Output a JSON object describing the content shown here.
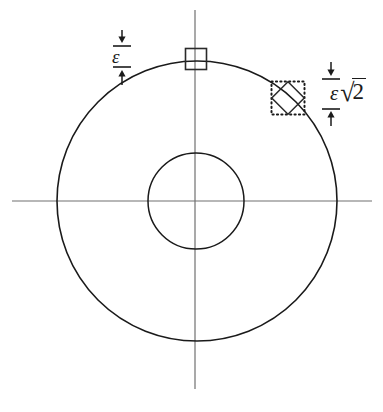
{
  "figure": {
    "background_color": "#ffffff",
    "width": 383,
    "height": 412
  },
  "colors": {
    "outer_circle": "#1a1a1a",
    "inner_circle": "#1a1a1a",
    "axis": "#707070",
    "cell_solid": "#2a2a2a",
    "cell_dotted": "#1a1a1a",
    "diamond": "#2a2a2a",
    "dimension": "#1b1b1b",
    "text": "#1b1b1b"
  },
  "axes": {
    "horizontal": {
      "x1": 12,
      "y1": 201,
      "x2": 372,
      "y2": 201
    },
    "vertical": {
      "x1": 195,
      "y1": 10,
      "x2": 195,
      "y2": 389
    }
  },
  "circles": {
    "outer": {
      "cx": 197,
      "cy": 201,
      "r": 140,
      "stroke_width": 1.6
    },
    "inner": {
      "cx": 196,
      "cy": 201,
      "r": 48,
      "stroke_width": 1.5
    }
  },
  "cells": {
    "axis_aligned": {
      "name": "square-cell-top",
      "cx": 196,
      "cy": 59,
      "size": 21,
      "stroke_style": "solid",
      "stroke_width": 1.6
    },
    "diagonal": {
      "name": "diagonal-cell-upper-right",
      "cx": 288,
      "cy": 98,
      "size": 33,
      "stroke_style": "dotted",
      "inner_rotation_deg": 45,
      "inner_size": 23
    }
  },
  "dimensions": {
    "left": {
      "label": "ε",
      "description": "epsilon",
      "arrow_top_x": 122,
      "arrow_top_y1": 30,
      "arrow_top_y2": 43,
      "tick_upper_y": 46,
      "tick_lower_y": 67,
      "arrow_bottom_y1": 85,
      "arrow_bottom_y2": 70,
      "tick_half_width": 9
    },
    "right": {
      "label_eps": "ε",
      "label_radical": "√",
      "label_radicand": "2",
      "label_full": "ε√2",
      "description": "epsilon times square root of two",
      "arrow_top_x": 331,
      "arrow_top_y1": 62,
      "arrow_top_y2": 76,
      "tick_upper_y": 79,
      "tick_lower_y": 109,
      "arrow_bottom_y1": 126,
      "arrow_bottom_y2": 111,
      "tick_half_width": 9
    }
  }
}
